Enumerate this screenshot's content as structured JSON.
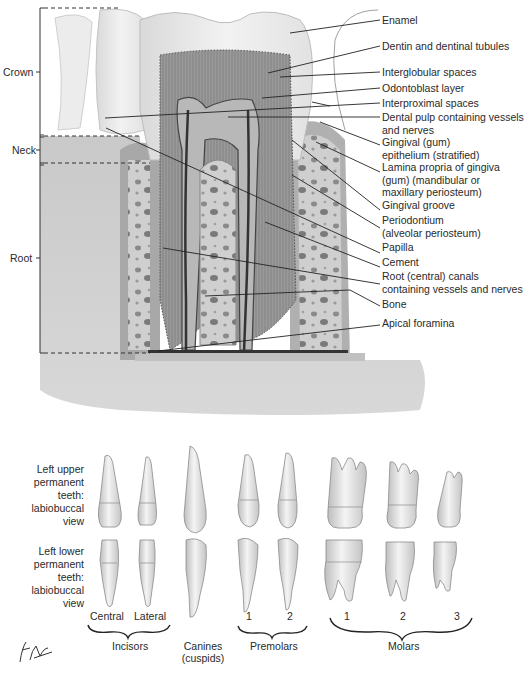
{
  "figure": {
    "regions": [
      {
        "label": "Crown"
      },
      {
        "label": "Neck"
      },
      {
        "label": "Root"
      }
    ],
    "section_labels": [
      {
        "lines": [
          "Enamel"
        ]
      },
      {
        "lines": [
          "Dentin and dentinal tubules"
        ]
      },
      {
        "lines": [
          "Interglobular spaces"
        ]
      },
      {
        "lines": [
          "Odontoblast layer"
        ]
      },
      {
        "lines": [
          "Interproximal spaces"
        ]
      },
      {
        "lines": [
          "Dental pulp containing vessels",
          "and nerves"
        ]
      },
      {
        "lines": [
          "Gingival (gum)",
          "epithelium (stratified)"
        ]
      },
      {
        "lines": [
          "Lamina propria of gingiva",
          "(gum) (mandibular or",
          "maxillary periosteum)"
        ]
      },
      {
        "lines": [
          "Gingival groove"
        ]
      },
      {
        "lines": [
          "Periodontium",
          "(alveolar periosteum)"
        ]
      },
      {
        "lines": [
          "Papilla"
        ]
      },
      {
        "lines": [
          "Cement"
        ]
      },
      {
        "lines": [
          "Root (central) canals",
          "containing vessels and nerves"
        ]
      },
      {
        "lines": [
          "Bone"
        ]
      },
      {
        "lines": [
          "Apical foramina"
        ]
      }
    ],
    "teeth": {
      "upper_row_label": [
        "Left upper",
        "permanent",
        "teeth:",
        "labiobuccal",
        "view"
      ],
      "lower_row_label": [
        "Left lower",
        "permanent",
        "teeth:",
        "labiobuccal",
        "view"
      ],
      "sub_labels": {
        "central": "Central",
        "lateral": "Lateral",
        "premolar_1": "1",
        "premolar_2": "2",
        "molar_1": "1",
        "molar_2": "2",
        "molar_3": "3"
      },
      "groups": {
        "incisors": "Incisors",
        "canines": "Canines",
        "canines_sub": "(cuspids)",
        "premolars": "Premolars",
        "molars": "Molars"
      }
    },
    "signature": "F. Netter"
  }
}
